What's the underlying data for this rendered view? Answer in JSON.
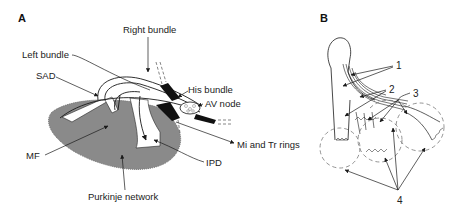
{
  "panels": {
    "a": {
      "label": "A",
      "annotations": {
        "right_bundle": "Right bundle",
        "left_bundle": "Left bundle",
        "sad": "SAD",
        "his_bundle": "His bundle",
        "av_node": "AV node",
        "mi_tr_rings": "Mi and Tr rings",
        "mf": "MF",
        "ipd": "IPD",
        "purkinje": "Purkinje network"
      }
    },
    "b": {
      "label": "B",
      "annotations": {
        "n1": "1",
        "n2": "2",
        "n3": "3",
        "n4": "4"
      }
    }
  },
  "colors": {
    "ventricle_fill": "#8a8a8a",
    "line": "#1a1a1a",
    "dashed": "#777777"
  }
}
